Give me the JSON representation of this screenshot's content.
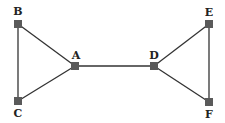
{
  "diagram": {
    "type": "graph",
    "nodes": [
      {
        "id": "B",
        "label": "B",
        "x": 18,
        "y": 24,
        "lx": 18,
        "ly": 15
      },
      {
        "id": "C",
        "label": "C",
        "x": 18,
        "y": 101,
        "lx": 18,
        "ly": 117
      },
      {
        "id": "A",
        "label": "A",
        "x": 75,
        "y": 66,
        "lx": 76,
        "ly": 59
      },
      {
        "id": "D",
        "label": "D",
        "x": 154,
        "y": 66,
        "lx": 154,
        "ly": 59
      },
      {
        "id": "E",
        "label": "E",
        "x": 209,
        "y": 24,
        "lx": 209,
        "ly": 16
      },
      {
        "id": "F",
        "label": "F",
        "x": 209,
        "y": 102,
        "lx": 209,
        "ly": 118
      }
    ],
    "edges": [
      [
        "B",
        "C"
      ],
      [
        "B",
        "A"
      ],
      [
        "C",
        "A"
      ],
      [
        "A",
        "D"
      ],
      [
        "D",
        "E"
      ],
      [
        "D",
        "F"
      ],
      [
        "E",
        "F"
      ]
    ],
    "colors": {
      "node": "#5a5a5a",
      "edge": "#333333",
      "label": "#222222"
    }
  }
}
